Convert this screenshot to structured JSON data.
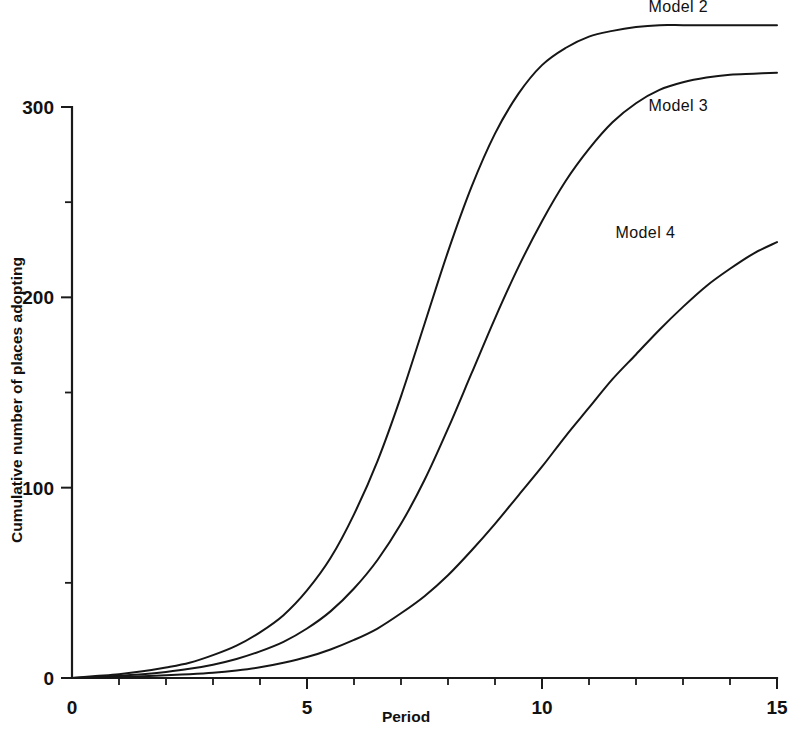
{
  "chart_data": {
    "type": "line",
    "title": "",
    "xlabel": "Period",
    "ylabel": "Cumulative number of places adopting",
    "xlim": [
      0,
      15
    ],
    "ylim": [
      0,
      350
    ],
    "grid": false,
    "legend_position": "inline-right-of-curve",
    "x_ticks_major": [
      0,
      5,
      10,
      15
    ],
    "x_tick_labels": [
      "0",
      "5",
      "10",
      "15"
    ],
    "x_ticks_minor": [
      1,
      2,
      3,
      4,
      6,
      7,
      8,
      9,
      11,
      12,
      13,
      14
    ],
    "y_ticks_major": [
      0,
      100,
      200,
      300
    ],
    "y_tick_labels": [
      "0",
      "100",
      "200",
      "300"
    ],
    "y_ticks_minor": [
      50,
      150,
      250
    ],
    "x": [
      0,
      0.5,
      1,
      1.5,
      2,
      2.5,
      3,
      3.5,
      4,
      4.5,
      5,
      5.5,
      6,
      6.5,
      7,
      7.5,
      8,
      8.5,
      9,
      9.5,
      10,
      10.5,
      11,
      11.5,
      12,
      12.5,
      13,
      13.5,
      14,
      14.5,
      15
    ],
    "series": [
      {
        "name": "Model 2",
        "label": "Model 2",
        "label_x": 12.9,
        "label_y": 350,
        "values": [
          0,
          1,
          2,
          3.5,
          5.5,
          8,
          12,
          17,
          24,
          33,
          46,
          63,
          86,
          114,
          148,
          186,
          224,
          258,
          286,
          307,
          322,
          331,
          337,
          340,
          342,
          343,
          343,
          343,
          343,
          343,
          343
        ]
      },
      {
        "name": "Model 3",
        "label": "Model 3",
        "label_x": 12.9,
        "label_y": 298,
        "values": [
          0,
          0.5,
          1.2,
          2,
          3.2,
          4.8,
          7,
          10,
          14,
          19,
          26,
          35,
          47,
          62,
          81,
          104,
          131,
          160,
          189,
          216,
          240,
          261,
          278,
          292,
          302,
          309,
          313,
          315.5,
          317,
          317.5,
          318
        ]
      },
      {
        "name": "Model 4",
        "label": "Model 4",
        "label_x": 12.2,
        "label_y": 231,
        "values": [
          0,
          0.2,
          0.5,
          0.9,
          1.4,
          2,
          2.8,
          4,
          5.6,
          8,
          11,
          15,
          20,
          26,
          34,
          43,
          54,
          67,
          81,
          96,
          111,
          127,
          142,
          157,
          170,
          183,
          195,
          206,
          215,
          223,
          229
        ]
      }
    ]
  },
  "geometry": {
    "origin_x": 72,
    "origin_y": 678,
    "px_per_period": 47,
    "px_per_unit": 1.9033,
    "tick_major_len": 11,
    "tick_minor_len": 7
  }
}
